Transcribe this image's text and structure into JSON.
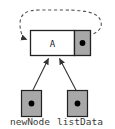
{
  "diagram": {
    "background_color": "#ffffff",
    "node": {
      "data_cell": {
        "value": "A",
        "fill": "#ffffff",
        "stroke": "#222222"
      },
      "next_cell": {
        "fill": "#a8a8a8",
        "stroke": "#222222",
        "dot_color": "#000000",
        "dot_label": ""
      }
    },
    "self_loop": {
      "style": "dashed",
      "color": "#555555",
      "from": "next-pointer",
      "to": "node-left-edge",
      "arrowhead": "solid-triangle"
    },
    "pointers": [
      {
        "name": "newNode",
        "label": "newNode",
        "fill": "#a8a8a8",
        "stroke": "#222222",
        "dot_color": "#000000",
        "target": "node"
      },
      {
        "name": "listData",
        "label": "listData",
        "fill": "#a8a8a8",
        "stroke": "#222222",
        "dot_color": "#000000",
        "target": "node"
      }
    ],
    "arrow_color": "#333333"
  }
}
